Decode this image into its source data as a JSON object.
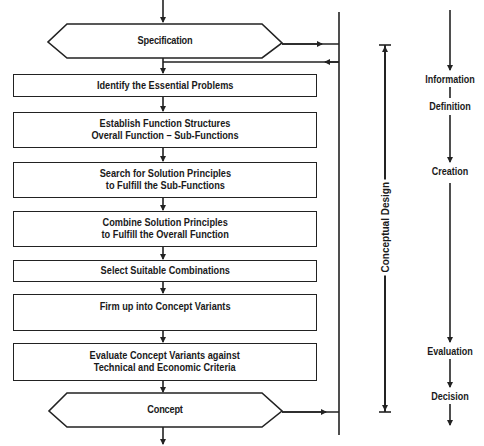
{
  "diagram": {
    "stages": {
      "start": "Specification",
      "end": "Concept"
    },
    "steps": [
      {
        "text": "Identify the Essential Problems"
      },
      {
        "text": "Establish Function Structures\nOverall Function – Sub-Functions"
      },
      {
        "text": "Search for Solution Principles\nto Fulfill the Sub-Functions"
      },
      {
        "text": "Combine Solution Principles\nto Fulfill the Overall Function"
      },
      {
        "text": "Select Suitable Combinations"
      },
      {
        "text": "Firm up into Concept Variants"
      },
      {
        "text": "Evaluate Concept Variants against\nTechnical and Economic Criteria"
      }
    ],
    "phase_label": "Conceptual Design",
    "activities": [
      "Information",
      "Definition",
      "Creation",
      "Evaluation",
      "Decision"
    ],
    "colors": {
      "line": "#222222",
      "background": "#ffffff",
      "text": "#1a1a1a"
    }
  }
}
